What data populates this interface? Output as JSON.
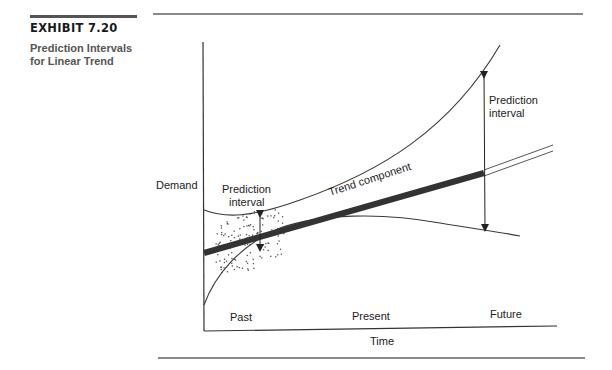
{
  "exhibit": {
    "number": "EXHIBIT 7.20",
    "title_line1": "Prediction Intervals",
    "title_line2": "for Linear Trend"
  },
  "diagram": {
    "y_axis_label": "Demand",
    "x_axis_label": "Time",
    "x_regions": [
      "Past",
      "Present",
      "Future"
    ],
    "annotations": {
      "past_interval_line1": "Prediction",
      "past_interval_line2": "interval",
      "future_interval_line1": "Prediction",
      "future_interval_line2": "interval",
      "trend": "Trend component"
    },
    "colors": {
      "line": "#3a3a3a",
      "trend": "#333333",
      "rule": "#8a8a8a"
    }
  }
}
